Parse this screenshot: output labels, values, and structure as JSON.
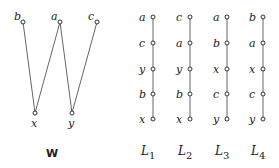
{
  "poset": {
    "caption": "W",
    "nodes": [
      "b",
      "a",
      "c",
      "x",
      "y"
    ],
    "top": [
      "b",
      "a",
      "c"
    ],
    "bottom": [
      "x",
      "y"
    ],
    "edges": [
      [
        "b",
        "x"
      ],
      [
        "a",
        "x"
      ],
      [
        "a",
        "y"
      ],
      [
        "c",
        "y"
      ]
    ]
  },
  "chains": [
    {
      "name": "L",
      "sub": "1",
      "order": [
        "a",
        "c",
        "y",
        "b",
        "x"
      ]
    },
    {
      "name": "L",
      "sub": "2",
      "order": [
        "c",
        "a",
        "y",
        "b",
        "x"
      ]
    },
    {
      "name": "L",
      "sub": "3",
      "order": [
        "a",
        "b",
        "x",
        "c",
        "y"
      ]
    },
    {
      "name": "L",
      "sub": "4",
      "order": [
        "b",
        "a",
        "x",
        "c",
        "y"
      ]
    }
  ]
}
